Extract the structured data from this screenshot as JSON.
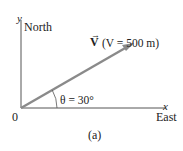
{
  "diagram": {
    "axes": {
      "y_label": "y",
      "y_direction": "North",
      "x_label": "x",
      "x_direction": "East",
      "origin_label": "0"
    },
    "vector": {
      "symbol": "V",
      "annotation": "(V = 500 m)",
      "magnitude_m": 500,
      "angle_deg": 30,
      "color": "#8a8a8a"
    },
    "angle_label": "θ = 30°",
    "caption": "(a)"
  }
}
